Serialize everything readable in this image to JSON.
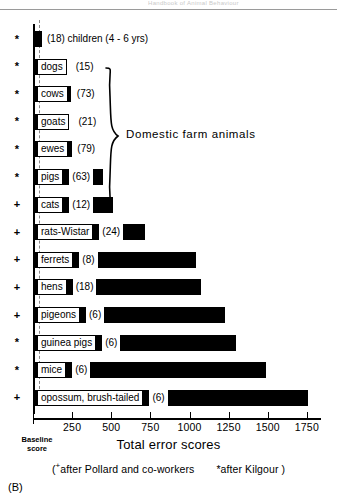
{
  "figure": {
    "panel_label": "(B)",
    "header_ghost": "Handbook of Animal Behaviour",
    "group_bracket_label": "Domestic farm animals",
    "baseline_label_line1": "Baseline",
    "baseline_label_line2": "score",
    "footnote_prefix": "(",
    "footnote_pollard": "after Pollard and co-workers",
    "footnote_kilgour": "after Kilgour )",
    "marker_plus": "+",
    "marker_star": "*"
  },
  "chart_data": {
    "type": "bar",
    "orientation": "horizontal",
    "title": "",
    "xlabel": "Total error scores",
    "ylabel": "",
    "xlim": [
      0,
      1840
    ],
    "grid": false,
    "legend": "none",
    "axis_ticks": [
      250,
      500,
      750,
      1000,
      1250,
      1500,
      1750
    ],
    "axis_tick_labels": [
      "250",
      "500",
      "750",
      "1000",
      "1250",
      "1500",
      "1750"
    ],
    "baseline_value": 40,
    "categories": [
      "children (4 - 6 yrs)",
      "dogs",
      "cows",
      "goats",
      "ewes",
      "pigs",
      "cats",
      "rats-Wistar",
      "ferrets",
      "hens",
      "pigeons",
      "guinea pigs",
      "mice",
      "opossum, brush-tailed"
    ],
    "values": [
      60,
      210,
      240,
      215,
      250,
      450,
      510,
      715,
      1040,
      1075,
      1230,
      1300,
      1490,
      1760
    ],
    "sample_sizes": [
      "(18)",
      "(15)",
      "(73)",
      "(21)",
      "(79)",
      "(63)",
      "(12)",
      "(24)",
      "(8)",
      "(18)",
      "(6)",
      "(6)",
      "(6)",
      "(6)"
    ],
    "markers": [
      "*",
      "*",
      "*",
      "*",
      "*",
      "*",
      "+",
      "+",
      "+",
      "+",
      "+",
      "*",
      "*",
      "+"
    ],
    "label_inside": [
      false,
      true,
      true,
      true,
      true,
      true,
      true,
      true,
      true,
      true,
      true,
      true,
      true,
      true
    ],
    "group_rows": [
      1,
      5
    ],
    "annotations": [
      "Domestic farm animals"
    ]
  },
  "rows": [
    {
      "marker": "*",
      "name": "children (4 - 6 yrs)",
      "n": "(18)",
      "value": 60,
      "name_first": false
    },
    {
      "marker": "*",
      "name": "dogs",
      "n": "(15)",
      "value": 210,
      "name_first": true
    },
    {
      "marker": "*",
      "name": "cows",
      "n": "(73)",
      "value": 240,
      "name_first": true
    },
    {
      "marker": "*",
      "name": "goats",
      "n": "(21)",
      "value": 215,
      "name_first": true
    },
    {
      "marker": "*",
      "name": "ewes",
      "n": "(79)",
      "value": 250,
      "name_first": true
    },
    {
      "marker": "*",
      "name": "pigs",
      "n": "(63)",
      "value": 450,
      "name_first": true
    },
    {
      "marker": "+",
      "name": "cats",
      "n": "(12)",
      "value": 510,
      "name_first": true
    },
    {
      "marker": "+",
      "name": "rats-Wistar",
      "n": "(24)",
      "value": 715,
      "name_first": true
    },
    {
      "marker": "+",
      "name": "ferrets",
      "n": "(8)",
      "value": 1040,
      "name_first": true
    },
    {
      "marker": "+",
      "name": "hens",
      "n": "(18)",
      "value": 1075,
      "name_first": true
    },
    {
      "marker": "+",
      "name": "pigeons",
      "n": "(6)",
      "value": 1230,
      "name_first": true
    },
    {
      "marker": "*",
      "name": "guinea pigs",
      "n": "(6)",
      "value": 1300,
      "name_first": true
    },
    {
      "marker": "*",
      "name": "mice",
      "n": "(6)",
      "value": 1490,
      "name_first": true
    },
    {
      "marker": "+",
      "name": "opossum, brush-tailed",
      "n": "(6)",
      "value": 1760,
      "name_first": true
    }
  ]
}
